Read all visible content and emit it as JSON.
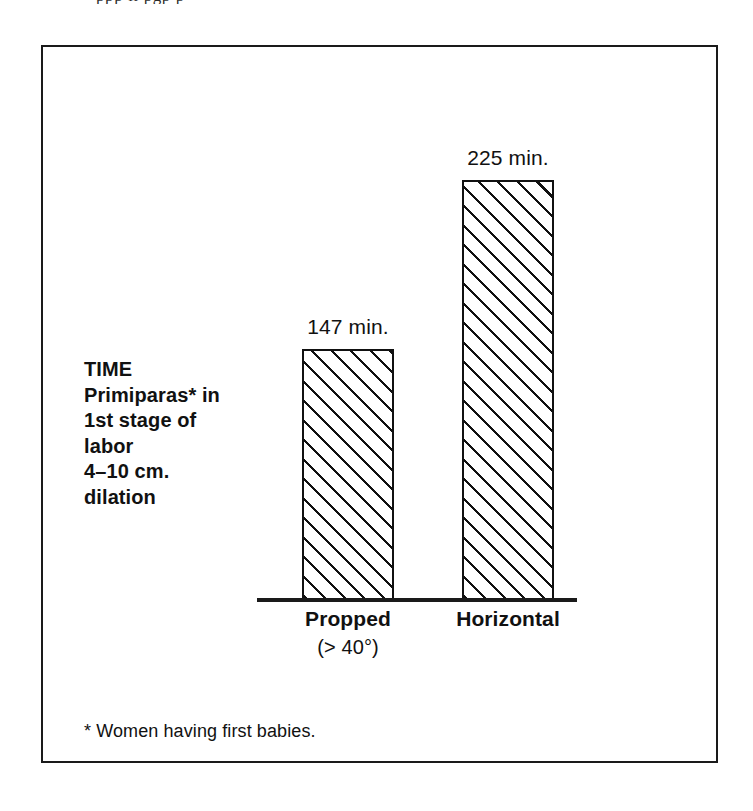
{
  "page": {
    "bleed_text": "ppp ll pgp p",
    "background_color": "#ffffff"
  },
  "figure": {
    "frame_color": "#1a1a1a",
    "series_caption_lines": [
      "TIME",
      "Primiparas* in",
      "1st stage of",
      "labor",
      "4–10 cm.",
      "dilation"
    ],
    "footnote": "* Women having first babies."
  },
  "chart_data": {
    "type": "bar",
    "title": "",
    "subtitle": "",
    "xlabel": "",
    "ylabel": "TIME Primiparas* in 1st stage of labor 4–10 cm. dilation",
    "unit": "min.",
    "categories": [
      "Propped",
      "Horizontal"
    ],
    "category_sublabels": [
      "(> 40°)",
      ""
    ],
    "values": [
      147,
      225
    ],
    "value_labels": [
      "147 min.",
      "225 min."
    ],
    "ylim": [
      0,
      240
    ],
    "grid": false,
    "legend": null,
    "bar_fill": "diagonal-hatch-45",
    "bar_edge_color": "#111111",
    "annotations": [
      "* Women having first babies."
    ]
  }
}
